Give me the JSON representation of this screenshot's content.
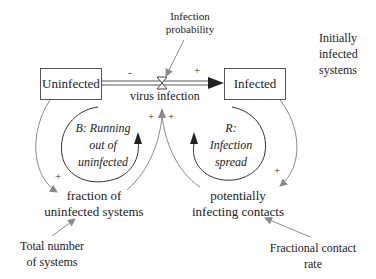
{
  "stocks": {
    "uninfected": "Uninfected",
    "infected": "Infected"
  },
  "flow": {
    "label": "virus infection"
  },
  "variables": {
    "infection_probability": [
      "Infection",
      "probability"
    ],
    "initially_infected": [
      "Initially",
      "infected",
      "systems"
    ],
    "fraction_uninfected": [
      "fraction of",
      "uninfected systems"
    ],
    "potentially_infecting": [
      "potentially",
      "infecting contacts"
    ],
    "total_number": [
      "Total number",
      "of systems"
    ],
    "fractional_contact": [
      "Fractional contact",
      "rate"
    ]
  },
  "loops": {
    "balancing": [
      "B: Running",
      "out of",
      "uninfected"
    ],
    "reinforcing": [
      "R:",
      "Infection",
      "spread"
    ]
  },
  "polarities": {
    "uninfected_to_flow": "-",
    "flow_to_infected": "+",
    "fraction_to_flow": "+",
    "contacts_to_flow": "+",
    "uninfected_to_fraction": "+",
    "infected_to_contacts": "+"
  },
  "colors": {
    "link": "#888888",
    "loop_arrow": "#333333",
    "box_border": "#555555"
  }
}
